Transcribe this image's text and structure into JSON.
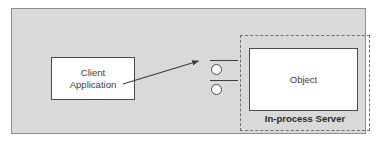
{
  "diagram": {
    "background_color": "#d9d9d9",
    "frame_border_color": "#8e8e8e",
    "nodes": {
      "client": {
        "label_line1": "Client",
        "label_line2": "Application",
        "fill": "#ffffff",
        "stroke": "#4a4a4a"
      },
      "object": {
        "label": "Object",
        "fill": "#ffffff",
        "stroke": "#4a4a4a"
      },
      "server": {
        "caption": "In-process Server",
        "border_style": "dashed",
        "stroke": "#6e6e6e"
      }
    },
    "interfaces": [
      {
        "name": "interface-top",
        "shape": "circle",
        "fill": "#ffffff",
        "stroke": "#4a4a4a"
      },
      {
        "name": "interface-bottom",
        "shape": "circle",
        "fill": "#ffffff",
        "stroke": "#4a4a4a"
      }
    ],
    "connectors": [
      {
        "name": "client-to-interface-top",
        "arrowhead": true,
        "stroke": "#3d3d3d"
      },
      {
        "name": "interface-top-to-object",
        "arrowhead": false,
        "stroke": "#3d3d3d"
      },
      {
        "name": "interface-bottom-to-object",
        "arrowhead": false,
        "stroke": "#3d3d3d"
      }
    ]
  }
}
